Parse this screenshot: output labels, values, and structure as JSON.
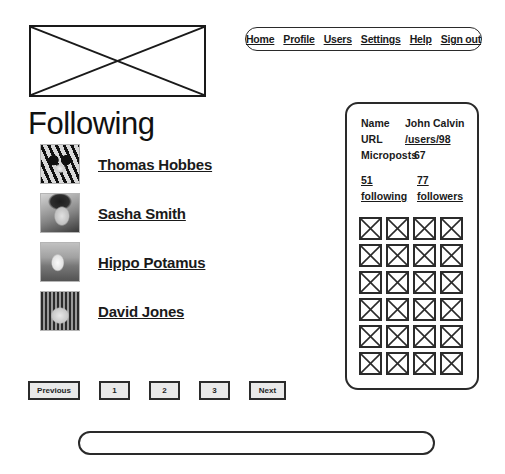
{
  "header": {
    "logo": {
      "icon": "image-placeholder-icon"
    },
    "nav": {
      "items": [
        {
          "label": "Home"
        },
        {
          "label": "Profile"
        },
        {
          "label": "Users"
        },
        {
          "label": "Settings"
        },
        {
          "label": "Help"
        },
        {
          "label": "Sign out"
        }
      ]
    }
  },
  "main": {
    "title": "Following",
    "users": [
      {
        "name": "Thomas Hobbes",
        "avatar": "tiger-avatar"
      },
      {
        "name": "Sasha Smith",
        "avatar": "woman-avatar"
      },
      {
        "name": "Hippo Potamus",
        "avatar": "bird-avatar"
      },
      {
        "name": "David Jones",
        "avatar": "child-avatar"
      }
    ],
    "pagination": {
      "previous": "Previous",
      "pages": [
        "1",
        "2",
        "3"
      ],
      "next": "Next"
    }
  },
  "sidebar": {
    "stats": [
      {
        "label": "Name",
        "value": "John Calvin",
        "is_link": false
      },
      {
        "label": "URL",
        "value": "/users/98",
        "is_link": true
      },
      {
        "label": "Microposts",
        "value": "67",
        "is_link": false
      }
    ],
    "follow": {
      "following_count": "51",
      "following_label": "following",
      "followers_count": "77",
      "followers_label": "followers"
    },
    "microposts_grid": {
      "columns": 4,
      "rows": 6,
      "total": 24,
      "icon": "image-placeholder-icon"
    }
  },
  "footer": {
    "text": ""
  },
  "colors": {
    "ink": "#1a1a1a",
    "border": "#2a2a2a",
    "button_fill": "#e9e9e9",
    "background": "#ffffff"
  }
}
